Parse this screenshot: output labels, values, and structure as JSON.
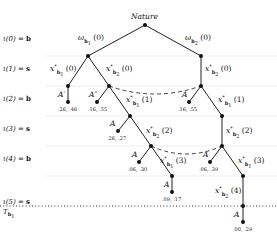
{
  "root": {
    "label": "Nature"
  },
  "stages": [
    {
      "iota": "ι(0)",
      "eq": "=",
      "value": "b"
    },
    {
      "iota": "ι(1)",
      "eq": "=",
      "value": "s"
    },
    {
      "iota": "ι(2)",
      "eq": "=",
      "value": "b"
    },
    {
      "iota": "ι(3)",
      "eq": "=",
      "value": "s"
    },
    {
      "iota": "ι(4)",
      "eq": "=",
      "value": "b"
    },
    {
      "iota": "ι(5)",
      "eq": "=",
      "value": "s"
    }
  ],
  "terminal_label": {
    "symbol": "T",
    "sub": "b",
    "subsub": "1"
  },
  "nature_branches": [
    {
      "sym": "ω",
      "sub": "b",
      "subsub": "1",
      "arg": "(0)"
    },
    {
      "sym": "ω",
      "sub": "b",
      "subsub": "2",
      "arg": "(0)"
    }
  ],
  "edges": {
    "e1": {
      "sym": "x",
      "sup": "*",
      "sub": "b",
      "subsub": "1",
      "arg": "(0)"
    },
    "e2": {
      "sym": "x",
      "sup": "*",
      "sub": "b",
      "subsub": "2",
      "arg": "(0)"
    },
    "e3": {
      "sym": "x",
      "sup": "*",
      "sub": "b",
      "subsub": "2",
      "arg": "(0)"
    },
    "e4": {
      "sym": "x",
      "sup": "*",
      "sub": "b",
      "subsub": "1",
      "arg": "(1)"
    },
    "e5": {
      "sym": "x",
      "sup": "*",
      "sub": "b",
      "subsub": "1",
      "arg": "(1)"
    },
    "e6": {
      "sym": "x",
      "sup": "*",
      "sub": "b",
      "subsub": "2",
      "arg": "(2)"
    },
    "e7": {
      "sym": "x",
      "sup": "*",
      "sub": "b",
      "subsub": "2",
      "arg": "(2)"
    },
    "e8": {
      "sym": "x",
      "sup": "*",
      "sub": "b",
      "subsub": "1",
      "arg": "(3)"
    },
    "e9": {
      "sym": "x",
      "sup": "*",
      "sub": "b",
      "subsub": "1",
      "arg": "(3)"
    },
    "e10": {
      "sym": "x",
      "sup": "*",
      "sub": "b",
      "subsub": "2",
      "arg": "(4)"
    }
  },
  "actions": {
    "a1": "A′",
    "a2": "A″",
    "a3": "A",
    "a4": "A",
    "a5": "A",
    "a6": "A",
    "a7": "A",
    "a8": "A"
  },
  "payoffs": {
    "p1": ".26, .46",
    "p2": ".16, .55",
    "p3": ".16, .55",
    "p4": ".26, .27",
    "p5": ".06, .30",
    "p6": ".06, .39",
    "p7": ".09, .17",
    "p8": ".00, .29"
  },
  "colors": {
    "edge": "#222222",
    "node": "#111111",
    "info_set": "#444444",
    "stage_line": "#e6e6e6",
    "terminal_line": "#333333"
  }
}
